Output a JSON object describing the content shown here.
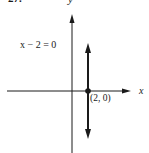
{
  "figure": {
    "number_label": "27.",
    "equation": "x − 2 = 0",
    "x_axis_label": "x",
    "y_axis_label": "y",
    "point_label": "(2, 0)",
    "point": {
      "x": 2,
      "y": 0
    },
    "line_type": "vertical",
    "colors": {
      "ink": "#1a1a1a",
      "background": "#ffffff"
    }
  }
}
